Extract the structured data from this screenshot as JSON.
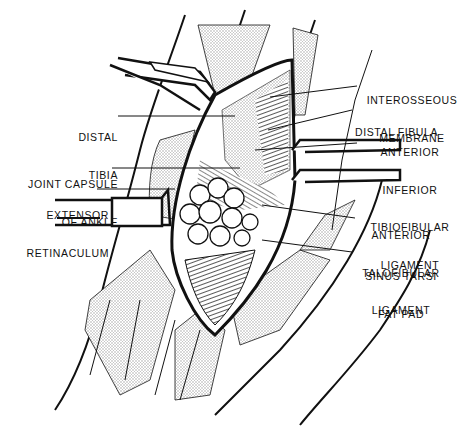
{
  "figure": {
    "ink_color": "#111111",
    "stipple_color": "#bdbdbd",
    "background": "#ffffff"
  },
  "labels": {
    "left": [
      {
        "id": "distal-tibia",
        "line1": "DISTAL",
        "line2": "TIBIA"
      },
      {
        "id": "joint-capsule",
        "line1": "JOINT CAPSULE",
        "line2": "OF ANKLE"
      },
      {
        "id": "extensor-retinaculum",
        "line1": "EXTENSOR",
        "line2": "RETINACULUM"
      }
    ],
    "right": [
      {
        "id": "interosseous-membrane",
        "line1": "INTEROSSEOUS",
        "line2": "MEMBRANE"
      },
      {
        "id": "distal-fibula",
        "line1": "DISTAL FIBULA"
      },
      {
        "id": "aitfl",
        "line1": "ANTERIOR",
        "line2": "INFERIOR",
        "line3": "TIBIOFIBULAR",
        "line4": "LIGAMENT"
      },
      {
        "id": "atfl",
        "line1": "ANTERIOR",
        "line2": "TALOFIBULAR",
        "line3": "LIGAMENT"
      },
      {
        "id": "sinus-tarsi",
        "line1": "SINUS TARSI",
        "line2": "FAT PAD"
      }
    ]
  }
}
